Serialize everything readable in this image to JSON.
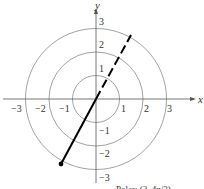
{
  "diagram": {
    "type": "polar-grid",
    "axes": {
      "x_label": "x",
      "y_label": "y"
    },
    "x_ticks": [
      {
        "value": -3,
        "label": "−3"
      },
      {
        "value": -2,
        "label": "−2"
      },
      {
        "value": -1,
        "label": "−1"
      },
      {
        "value": 1,
        "label": "1"
      },
      {
        "value": 2,
        "label": "2"
      },
      {
        "value": 3,
        "label": "3"
      }
    ],
    "y_ticks": [
      {
        "value": 3,
        "label": "3"
      },
      {
        "value": 2,
        "label": "2"
      },
      {
        "value": 1,
        "label": "1"
      },
      {
        "value": -1,
        "label": "−1"
      },
      {
        "value": -2,
        "label": "−2"
      },
      {
        "value": -3,
        "label": "−3"
      }
    ],
    "circles_radii": [
      1,
      2,
      3
    ],
    "solid_ray": {
      "from": [
        0,
        0
      ],
      "to_polar": {
        "r": 2,
        "theta": "4π/3"
      }
    },
    "dashed_ray": {
      "direction": "π/3"
    },
    "point": {
      "label": "Polar: (2, 4π/3)"
    },
    "colors": {
      "grid": "#8a8a8a",
      "axis": "#555555",
      "ray": "#000000"
    }
  }
}
